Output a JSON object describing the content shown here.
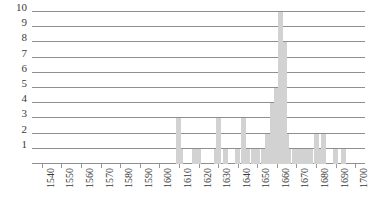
{
  "chart_data": {
    "type": "bar",
    "title": "",
    "subtitle": "",
    "xlabel": "",
    "ylabel": "",
    "grid": true,
    "legend": null,
    "xlim": [
      1535,
      1705
    ],
    "ylim": [
      0,
      10
    ],
    "ytick_labels": [
      "1",
      "2",
      "3",
      "4",
      "5",
      "6",
      "7",
      "8",
      "9",
      "10"
    ],
    "ytick_values": [
      1,
      2,
      3,
      4,
      5,
      6,
      7,
      8,
      9,
      10
    ],
    "xtick_labels": [
      "1540",
      "1550",
      "1560",
      "1570",
      "1580",
      "1590",
      "1600",
      "1610",
      "1620",
      "1630",
      "1640",
      "1650",
      "1660",
      "1670",
      "1680",
      "1690",
      "1700"
    ],
    "xtick_values": [
      1540,
      1550,
      1560,
      1570,
      1580,
      1590,
      1600,
      1610,
      1620,
      1630,
      1640,
      1650,
      1660,
      1670,
      1680,
      1690,
      1700
    ],
    "bar_color": "#d2d2d2",
    "grid_color": "#8f8f8f",
    "categories": [
      1610,
      1611,
      1618,
      1620,
      1629,
      1630,
      1634,
      1640,
      1643,
      1645,
      1648,
      1650,
      1653,
      1655,
      1657,
      1658,
      1659,
      1660,
      1661,
      1662,
      1663,
      1664,
      1665,
      1666,
      1669,
      1671,
      1673,
      1675,
      1677,
      1680,
      1682,
      1684,
      1690,
      1694
    ],
    "values": [
      3,
      1,
      1,
      1,
      1,
      3,
      1,
      1,
      3,
      1,
      1,
      1,
      1,
      2,
      1,
      4,
      2,
      5,
      2,
      10,
      2,
      8,
      2,
      1,
      1,
      1,
      1,
      1,
      1,
      2,
      1,
      2,
      1,
      1
    ]
  }
}
